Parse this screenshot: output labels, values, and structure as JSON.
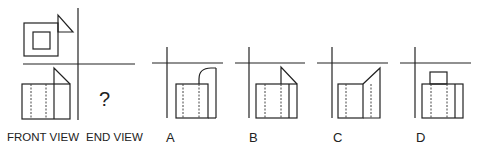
{
  "question": {
    "unknown_symbol": "?",
    "labels": {
      "front_view": "FRONT VIEW",
      "end_view": "END VIEW"
    }
  },
  "options": [
    {
      "letter": "A"
    },
    {
      "letter": "B"
    },
    {
      "letter": "C"
    },
    {
      "letter": "D"
    }
  ],
  "colors": {
    "line": "#222222",
    "background": "#ffffff"
  }
}
